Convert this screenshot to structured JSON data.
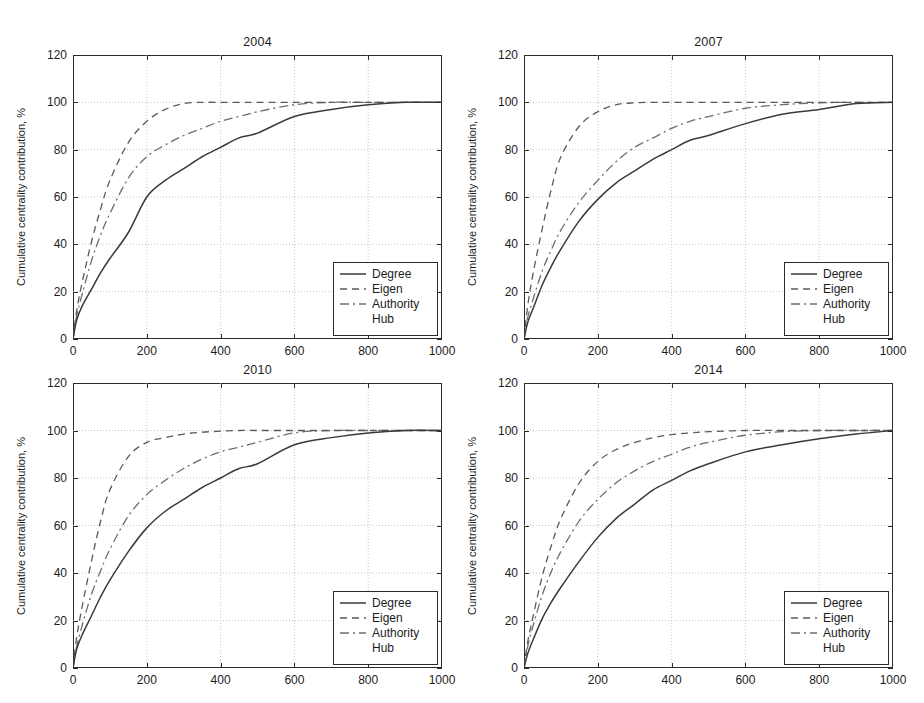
{
  "figure": {
    "background": "#ffffff",
    "axis_color": "#2b2b2b",
    "grid_color": "#b9b9b9"
  },
  "axes_common": {
    "ylabel": "Cumulative centrality contribution, %",
    "yticks": [
      "0",
      "20",
      "40",
      "60",
      "80",
      "100",
      "120"
    ],
    "xticks": [
      "0",
      "200",
      "400",
      "600",
      "800",
      "1000"
    ],
    "xlim": [
      0,
      1000
    ],
    "ylim": [
      0,
      120
    ],
    "grid": true
  },
  "legend": {
    "entries": [
      {
        "label": "Degree",
        "style": "solid",
        "color": "#3a3a3a"
      },
      {
        "label": "Eigen",
        "style": "dashed",
        "color": "#5a5a5a"
      },
      {
        "label": "Authority",
        "style": "dashdot",
        "color": "#6e6e6e"
      },
      {
        "label": "Hub",
        "style": "dotted-faint",
        "color": "#c9c9c9"
      }
    ]
  },
  "chart_data": [
    {
      "type": "line",
      "title": "2004",
      "xlabel": "",
      "ylabel": "Cumulative centrality contribution, %",
      "xlim": [
        0,
        1000
      ],
      "ylim": [
        0,
        120
      ],
      "xticks": [
        0,
        200,
        400,
        600,
        800,
        1000
      ],
      "yticks": [
        0,
        20,
        40,
        60,
        80,
        100,
        120
      ],
      "grid": true,
      "legend_position": "lower right",
      "x": [
        0,
        10,
        25,
        50,
        75,
        100,
        150,
        200,
        250,
        300,
        350,
        400,
        450,
        500,
        600,
        700,
        800,
        900,
        1000
      ],
      "series": [
        {
          "name": "Degree",
          "style": "solid",
          "values": [
            0,
            8,
            14,
            21,
            28,
            34,
            45,
            60,
            67,
            72,
            77,
            81,
            85,
            87,
            94,
            97,
            99,
            100,
            100
          ]
        },
        {
          "name": "Eigen",
          "style": "dashed",
          "values": [
            0,
            12,
            24,
            41,
            55,
            67,
            83,
            92,
            97,
            99.5,
            100,
            100,
            100,
            100,
            100,
            100,
            100,
            100,
            100
          ]
        },
        {
          "name": "Authority",
          "style": "dashdot",
          "values": [
            0,
            10,
            19,
            33,
            44,
            53,
            68,
            77,
            82,
            86,
            89,
            92,
            94,
            96,
            99,
            100,
            100,
            100,
            100
          ]
        },
        {
          "name": "Hub",
          "style": "dotted-faint",
          "values": [
            0,
            10,
            19,
            33,
            44,
            53,
            68,
            77,
            82,
            86,
            89,
            92,
            94,
            96,
            99,
            100,
            100,
            100,
            100
          ]
        }
      ]
    },
    {
      "type": "line",
      "title": "2007",
      "xlabel": "",
      "ylabel": "Cumulative centrality contribution, %",
      "xlim": [
        0,
        1000
      ],
      "ylim": [
        0,
        120
      ],
      "xticks": [
        0,
        200,
        400,
        600,
        800,
        1000
      ],
      "yticks": [
        0,
        20,
        40,
        60,
        80,
        100,
        120
      ],
      "grid": true,
      "legend_position": "lower right",
      "x": [
        0,
        10,
        25,
        50,
        75,
        100,
        150,
        200,
        250,
        300,
        350,
        400,
        450,
        500,
        600,
        700,
        800,
        900,
        1000
      ],
      "series": [
        {
          "name": "Degree",
          "style": "solid",
          "values": [
            0,
            7,
            13,
            23,
            31,
            38,
            50,
            59,
            66,
            71,
            76,
            80,
            84,
            86,
            91,
            95,
            97,
            99.5,
            100
          ]
        },
        {
          "name": "Eigen",
          "style": "dashed",
          "values": [
            0,
            14,
            28,
            47,
            64,
            77,
            90,
            96,
            99,
            99.8,
            100,
            100,
            100,
            100,
            100,
            100,
            100,
            100,
            100
          ]
        },
        {
          "name": "Authority",
          "style": "dashdot",
          "values": [
            0,
            9,
            17,
            29,
            38,
            46,
            58,
            67,
            75,
            81,
            85,
            89,
            92,
            94,
            97.5,
            99,
            99.8,
            100,
            100
          ]
        },
        {
          "name": "Hub",
          "style": "dotted-faint",
          "values": [
            0,
            9,
            17,
            29,
            38,
            46,
            58,
            67,
            75,
            81,
            85,
            89,
            92,
            94,
            97.5,
            99,
            99.8,
            100,
            100
          ]
        }
      ]
    },
    {
      "type": "line",
      "title": "2010",
      "xlabel": "",
      "ylabel": "Cumulative centrality contribution, %",
      "xlim": [
        0,
        1000
      ],
      "ylim": [
        0,
        120
      ],
      "xticks": [
        0,
        200,
        400,
        600,
        800,
        1000
      ],
      "yticks": [
        0,
        20,
        40,
        60,
        80,
        100,
        120
      ],
      "grid": true,
      "legend_position": "lower right",
      "x": [
        0,
        10,
        25,
        50,
        75,
        100,
        150,
        200,
        250,
        300,
        350,
        400,
        450,
        500,
        600,
        700,
        800,
        900,
        1000
      ],
      "series": [
        {
          "name": "Degree",
          "style": "solid",
          "values": [
            0,
            8,
            14,
            22,
            30,
            37,
            49,
            59,
            66,
            71,
            76,
            80,
            84,
            86,
            94,
            97,
            99,
            100,
            100
          ]
        },
        {
          "name": "Eigen",
          "style": "dashed",
          "values": [
            0,
            13,
            26,
            45,
            62,
            75,
            89,
            95,
            97,
            98.5,
            99.3,
            99.7,
            100,
            100,
            100,
            100,
            100,
            100,
            100
          ]
        },
        {
          "name": "Authority",
          "style": "dashdot",
          "values": [
            0,
            9,
            18,
            31,
            41,
            50,
            64,
            73,
            79,
            84,
            88,
            91,
            93,
            95,
            99,
            100,
            100,
            100,
            100
          ]
        },
        {
          "name": "Hub",
          "style": "dotted-faint",
          "values": [
            0,
            9,
            18,
            31,
            41,
            50,
            64,
            73,
            79,
            84,
            88,
            91,
            93,
            95,
            99,
            100,
            100,
            100,
            100
          ]
        }
      ]
    },
    {
      "type": "line",
      "title": "2014",
      "xlabel": "",
      "ylabel": "Cumulative centrality contribution, %",
      "xlim": [
        0,
        1000
      ],
      "ylim": [
        0,
        120
      ],
      "xticks": [
        0,
        200,
        400,
        600,
        800,
        1000
      ],
      "yticks": [
        0,
        20,
        40,
        60,
        80,
        100,
        120
      ],
      "grid": true,
      "legend_position": "lower right",
      "x": [
        0,
        10,
        25,
        50,
        75,
        100,
        150,
        200,
        250,
        300,
        350,
        400,
        450,
        500,
        600,
        700,
        800,
        900,
        1000
      ],
      "series": [
        {
          "name": "Degree",
          "style": "solid",
          "values": [
            0,
            6,
            12,
            21,
            28,
            34,
            45,
            55,
            63,
            69,
            75,
            79,
            83,
            86,
            91,
            94,
            96.5,
            98.5,
            100
          ]
        },
        {
          "name": "Eigen",
          "style": "dashed",
          "values": [
            0,
            11,
            22,
            39,
            52,
            63,
            78,
            87,
            92,
            95,
            97,
            98.3,
            99,
            99.5,
            100,
            100,
            100,
            100,
            100
          ]
        },
        {
          "name": "Authority",
          "style": "dashdot",
          "values": [
            0,
            9,
            18,
            31,
            41,
            49,
            62,
            71,
            78,
            83,
            87,
            90,
            93,
            95,
            98,
            99.5,
            100,
            100,
            100
          ]
        },
        {
          "name": "Hub",
          "style": "dotted-faint",
          "values": [
            0,
            9,
            18,
            31,
            41,
            49,
            62,
            71,
            78,
            83,
            87,
            90,
            93,
            95,
            98,
            99.5,
            100,
            100,
            100
          ]
        }
      ]
    }
  ]
}
